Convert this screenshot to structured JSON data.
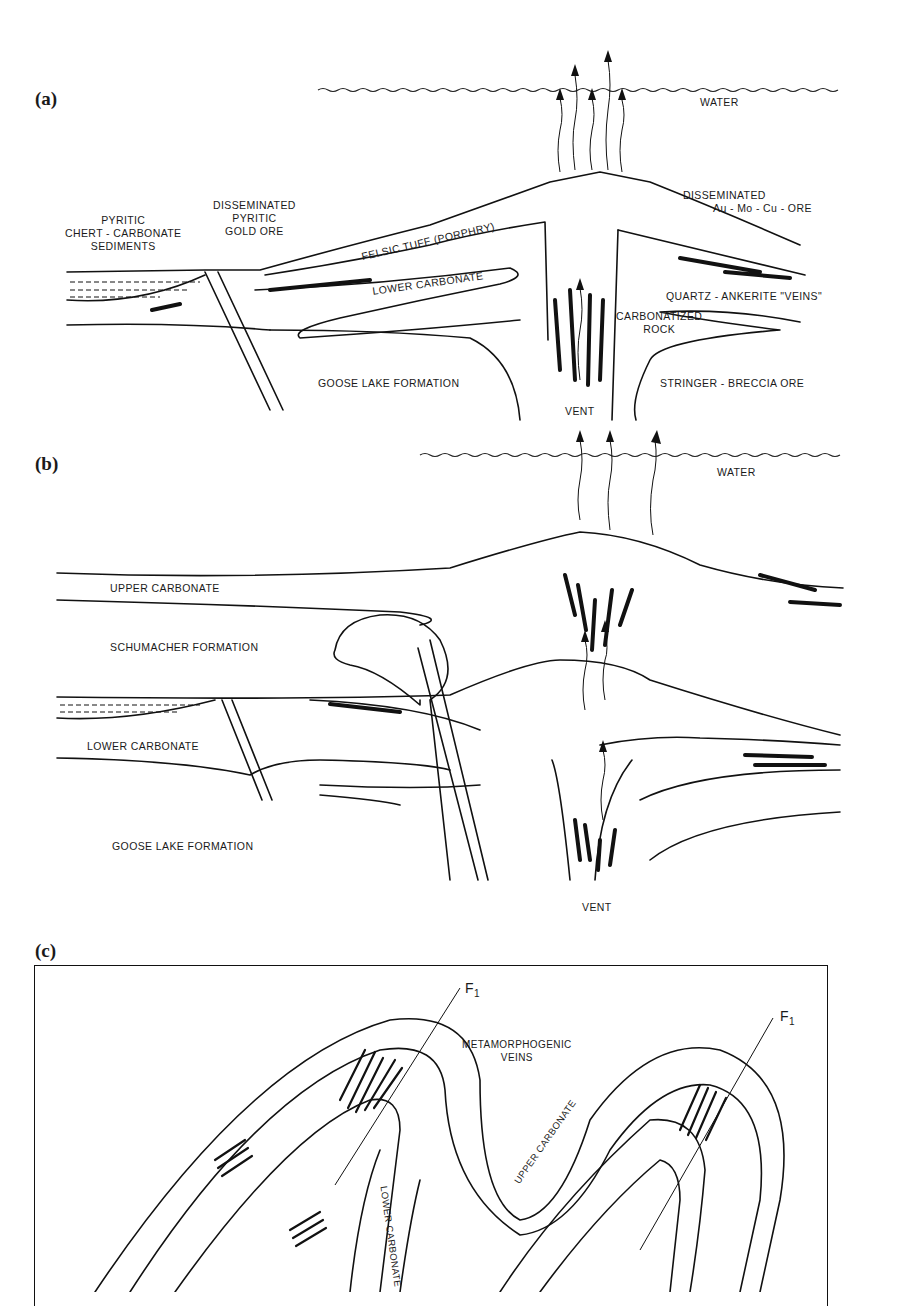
{
  "figure": {
    "panels": [
      {
        "id": "a",
        "label": "(a)",
        "labels": {
          "water": "WATER",
          "pyritic_sediments": [
            "PYRITIC",
            "CHERT - CARBONATE",
            "SEDIMENTS"
          ],
          "disseminated_pyritic": [
            "DISSEMINATED",
            "PYRITIC",
            "GOLD ORE"
          ],
          "felsic_tuff": "FELSIC TUFF (PORPHRY)",
          "lower_carbonate": "LOWER CARBONATE",
          "disseminated_au": [
            "DISSEMINATED",
            "Au - Mo - Cu - ORE"
          ],
          "quartz_ankerite": "QUARTZ - ANKERITE \"VEINS\"",
          "carbonatized": [
            "CARBONATIZED",
            "ROCK"
          ],
          "goose_lake": "GOOSE LAKE FORMATION",
          "stringer_breccia": "STRINGER - BRECCIA ORE",
          "vent": "VENT"
        }
      },
      {
        "id": "b",
        "label": "(b)",
        "labels": {
          "water": "WATER",
          "upper_carbonate": "UPPER CARBONATE",
          "schumacher": "SCHUMACHER FORMATION",
          "lower_carbonate": "LOWER CARBONATE",
          "goose_lake": "GOOSE LAKE FORMATION",
          "vent": "VENT"
        }
      },
      {
        "id": "c",
        "label": "(c)",
        "labels": {
          "fold_axis_1": "F",
          "fold_axis_1_sub": "1",
          "fold_axis_2": "F",
          "fold_axis_2_sub": "1",
          "metamorphogenic": [
            "METAMORPHOGENIC",
            "VEINS"
          ],
          "upper_carbonate": "UPPER CARBONATE",
          "lower_carbonate": "LOWER CARBONATE"
        }
      }
    ]
  }
}
